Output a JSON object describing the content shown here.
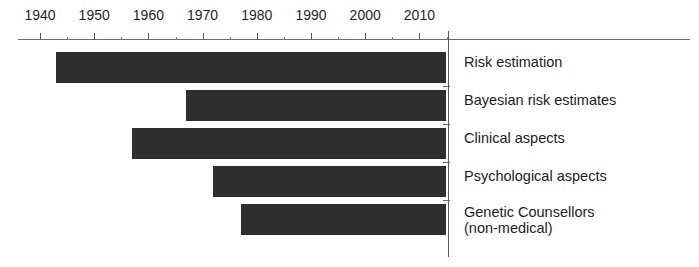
{
  "chart_data": {
    "type": "bar",
    "orientation": "horizontal",
    "subtype": "timeline-gantt",
    "title": "",
    "xlabel": "",
    "ylabel": "",
    "xlim": [
      1936,
      2016
    ],
    "grid": false,
    "legend": "none",
    "axis_position": "top",
    "tick_labels": [
      "1940",
      "1950",
      "1960",
      "1970",
      "1980",
      "1990",
      "2000",
      "2010"
    ],
    "major_ticks": [
      1940,
      1950,
      1960,
      1970,
      1980,
      1990,
      2000,
      2010
    ],
    "minor_ticks": [
      1945,
      1955,
      1965,
      1975,
      1985,
      1995,
      2005,
      2015
    ],
    "categories": [
      "Risk estimation",
      "Bayesian risk estimates",
      "Clinical aspects",
      "Psychological aspects",
      "Genetic Counsellors\n(non-medical)"
    ],
    "bars": [
      {
        "label": "Risk estimation",
        "start": 1943,
        "end": 2015
      },
      {
        "label": "Bayesian risk estimates",
        "start": 1967,
        "end": 2015
      },
      {
        "label": "Clinical aspects",
        "start": 1957,
        "end": 2015
      },
      {
        "label": "Psychological aspects",
        "start": 1972,
        "end": 2015
      },
      {
        "label": "Genetic Counsellors\n(non-medical)",
        "start": 1977,
        "end": 2015
      }
    ],
    "colors": {
      "bar_fill": "#2e2e2e",
      "axis": "#6d6d6d",
      "text": "#1c1c1c",
      "background": "#ffffff"
    }
  },
  "axis": {
    "ticks": [
      {
        "year": 1940,
        "label": "1940",
        "major": true
      },
      {
        "year": 1945,
        "label": "",
        "major": false
      },
      {
        "year": 1950,
        "label": "1950",
        "major": true
      },
      {
        "year": 1955,
        "label": "",
        "major": false
      },
      {
        "year": 1960,
        "label": "1960",
        "major": true
      },
      {
        "year": 1965,
        "label": "",
        "major": false
      },
      {
        "year": 1970,
        "label": "1970",
        "major": true
      },
      {
        "year": 1975,
        "label": "",
        "major": false
      },
      {
        "year": 1980,
        "label": "1980",
        "major": true
      },
      {
        "year": 1985,
        "label": "",
        "major": false
      },
      {
        "year": 1990,
        "label": "1990",
        "major": true
      },
      {
        "year": 1995,
        "label": "",
        "major": false
      },
      {
        "year": 2000,
        "label": "2000",
        "major": true
      },
      {
        "year": 2005,
        "label": "",
        "major": false
      },
      {
        "year": 2010,
        "label": "2010",
        "major": true
      },
      {
        "year": 2015,
        "label": "",
        "major": false
      }
    ]
  },
  "rows": [
    {
      "label": "Risk estimation",
      "start": 1943,
      "end": 2015
    },
    {
      "label": "Bayesian risk estimates",
      "start": 1967,
      "end": 2015
    },
    {
      "label": "Clinical aspects",
      "start": 1957,
      "end": 2015
    },
    {
      "label": "Psychological aspects",
      "start": 1972,
      "end": 2015
    },
    {
      "label": "Genetic Counsellors\n(non-medical)",
      "start": 1977,
      "end": 2015
    }
  ]
}
